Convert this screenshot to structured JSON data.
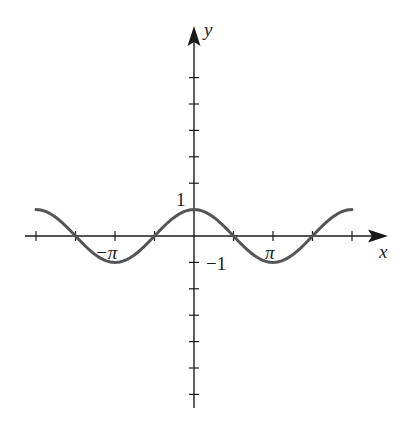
{
  "chart_data": {
    "type": "line",
    "title": "",
    "function": "y = cos(x)",
    "xlabel": "x",
    "ylabel": "y",
    "xlim": [
      -6.28,
      6.28
    ],
    "ylim": [
      -6,
      6
    ],
    "x_tick_step": "pi/2",
    "y_tick_step": 1,
    "x_tick_labels": [
      {
        "value": -3.1416,
        "label": "−π"
      },
      {
        "value": 3.1416,
        "label": "π"
      }
    ],
    "y_tick_labels": [
      {
        "value": 1,
        "label": "1"
      },
      {
        "value": -1,
        "label": "−1"
      }
    ],
    "series": [
      {
        "name": "cos(x)",
        "x": [
          -6.2832,
          -4.7124,
          -3.1416,
          -1.5708,
          0,
          1.5708,
          3.1416,
          4.7124,
          6.2832
        ],
        "values": [
          1,
          0,
          -1,
          0,
          1,
          0,
          -1,
          0,
          1
        ]
      }
    ],
    "grid": false,
    "legend": null
  },
  "labels": {
    "x_axis": "x",
    "y_axis": "y",
    "one": "1",
    "neg_one": "−1",
    "pi": "π",
    "neg_pi": "−π"
  },
  "colors": {
    "axis": "#1a1a1a",
    "curve": "#555555"
  }
}
